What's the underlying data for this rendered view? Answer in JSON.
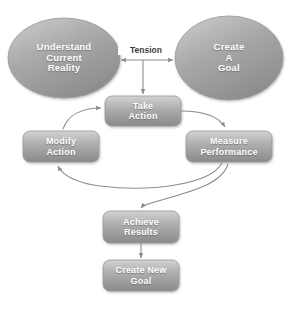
{
  "diagram": {
    "background_color": "#ffffff",
    "palette": {
      "ellipse_fill_light": "#c3c3c3",
      "ellipse_fill_dark": "#8e8e8e",
      "box_fill_light": "#cfcfcf",
      "box_fill_dark": "#8a8a8a",
      "node_border": "#9a9a9a",
      "label_text": "#ffffff",
      "edge_label_text": "#3d3d3d",
      "connector": "#8c8c8c"
    },
    "nodes": [
      {
        "id": "understand-current-reality",
        "shape": "ellipse",
        "lines": [
          "Understand",
          "Current",
          "Reality"
        ],
        "text": "Understand Current Reality"
      },
      {
        "id": "create-a-goal",
        "shape": "ellipse",
        "lines": [
          "Create",
          "A",
          "Goal"
        ],
        "text": "Create A Goal"
      },
      {
        "id": "take-action",
        "shape": "rounded-rect",
        "lines": [
          "Take",
          "Action"
        ],
        "text": "Take Action"
      },
      {
        "id": "modify-action",
        "shape": "rounded-rect",
        "lines": [
          "Modify",
          "Action"
        ],
        "text": "Modify Action"
      },
      {
        "id": "measure-performance",
        "shape": "rounded-rect",
        "lines": [
          "Measure",
          "Performance"
        ],
        "text": "Measure Performance"
      },
      {
        "id": "achieve-results",
        "shape": "rounded-rect",
        "lines": [
          "Achieve",
          "Results"
        ],
        "text": "Achieve Results"
      },
      {
        "id": "create-new-goal",
        "shape": "rounded-rect",
        "lines": [
          "Create New",
          "Goal"
        ],
        "text": "Create New Goal"
      }
    ],
    "edges": [
      {
        "id": "tension",
        "from": "understand-current-reality",
        "to": "create-a-goal",
        "label": "Tension",
        "style": "double-arrow-horizontal"
      },
      {
        "id": "tension-to-take-action",
        "from": "tension",
        "to": "take-action",
        "label": "",
        "style": "straight-arrow-down"
      },
      {
        "id": "take-action-to-measure-performance",
        "from": "take-action",
        "to": "measure-performance",
        "label": "",
        "style": "curved-arrow"
      },
      {
        "id": "measure-performance-to-modify-action",
        "from": "measure-performance",
        "to": "modify-action",
        "label": "",
        "style": "curved-arrow"
      },
      {
        "id": "modify-action-to-take-action",
        "from": "modify-action",
        "to": "take-action",
        "label": "",
        "style": "curved-arrow"
      },
      {
        "id": "measure-performance-to-achieve-results",
        "from": "measure-performance",
        "to": "achieve-results",
        "label": "",
        "style": "curved-arrow"
      },
      {
        "id": "achieve-results-to-create-new-goal",
        "from": "achieve-results",
        "to": "create-new-goal",
        "label": "",
        "style": "straight-arrow-down"
      }
    ]
  }
}
